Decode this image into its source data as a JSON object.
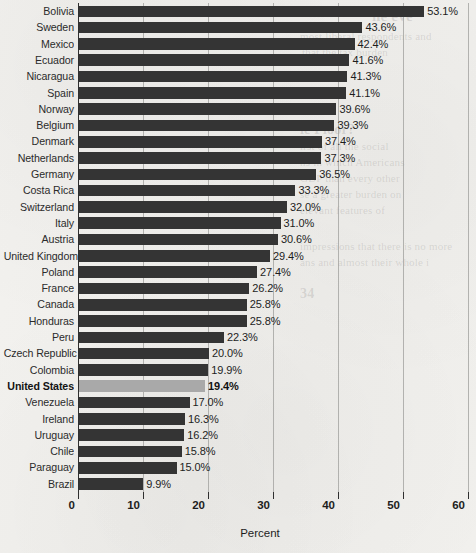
{
  "chart_data": {
    "type": "bar",
    "orientation": "horizontal",
    "title": "",
    "xlabel": "Percent",
    "ylabel": "",
    "xlim": [
      0,
      60
    ],
    "xticks": [
      0,
      10,
      20,
      30,
      40,
      50,
      60
    ],
    "grid": true,
    "legend": false,
    "value_label_suffix": "%",
    "highlight_category": "United States",
    "categories": [
      "Bolivia",
      "Sweden",
      "Mexico",
      "Ecuador",
      "Nicaragua",
      "Spain",
      "Norway",
      "Belgium",
      "Denmark",
      "Netherlands",
      "Germany",
      "Costa Rica",
      "Switzerland",
      "Italy",
      "Austria",
      "United Kingdom",
      "Poland",
      "France",
      "Canada",
      "Honduras",
      "Peru",
      "Czech Republic",
      "Colombia",
      "United States",
      "Venezuela",
      "Ireland",
      "Uruguay",
      "Chile",
      "Paraguay",
      "Brazil"
    ],
    "values": [
      53.1,
      43.6,
      42.4,
      41.6,
      41.3,
      41.1,
      39.6,
      39.3,
      37.4,
      37.3,
      36.5,
      33.3,
      32.0,
      31.0,
      30.6,
      29.4,
      27.4,
      26.2,
      25.8,
      25.8,
      22.3,
      20.0,
      19.9,
      19.4,
      17.0,
      16.3,
      16.2,
      15.8,
      15.0,
      9.9
    ],
    "value_labels": [
      "53.1%",
      "43.6%",
      "42.4%",
      "41.6%",
      "41.3%",
      "41.1%",
      "39.6%",
      "39.3%",
      "37.4%",
      "37.3%",
      "36.5%",
      "33.3%",
      "32.0%",
      "31.0%",
      "30.6%",
      "29.4%",
      "27.4%",
      "26.2%",
      "25.8%",
      "25.8%",
      "22.3%",
      "20.0%",
      "19.9%",
      "19.4%",
      "17.0%",
      "16.3%",
      "16.2%",
      "15.8%",
      "15.0%",
      "9.9%"
    ],
    "tick_labels": [
      "0",
      "10",
      "20",
      "30",
      "40",
      "50",
      "60"
    ],
    "colors": {
      "bar": "#343434",
      "bar_highlight": "#a9a9a9",
      "axis": "#2f2f2f",
      "gridline": "#9d9d9b",
      "background": "#f1f0ed",
      "text": "#1d1d1d"
    }
  },
  "page_background_text": [
    {
      "text": "he eve",
      "x": 372,
      "y": 8,
      "size": 15,
      "weight": "bold"
    },
    {
      "text": "most liberal respondents and",
      "x": 300,
      "y": 30,
      "size": 11,
      "weight": "normal"
    },
    {
      "text": "that the tax burden",
      "x": 302,
      "y": 46,
      "size": 11,
      "weight": "normal"
    },
    {
      "text": "ic Floor?",
      "x": 300,
      "y": 122,
      "size": 14,
      "weight": "bold"
    },
    {
      "text": "irst of all the social",
      "x": 300,
      "y": 140,
      "size": 11,
      "weight": "normal"
    },
    {
      "text": "ns in which Americans",
      "x": 300,
      "y": 156,
      "size": 11,
      "weight": "normal"
    },
    {
      "text": "GDP than every other",
      "x": 300,
      "y": 172,
      "size": 11,
      "weight": "normal"
    },
    {
      "text": "se a greater burden on",
      "x": 300,
      "y": 188,
      "size": 11,
      "weight": "normal"
    },
    {
      "text": "elevant features of",
      "x": 300,
      "y": 204,
      "size": 11,
      "weight": "normal"
    },
    {
      "text": "impressions that there is no more",
      "x": 300,
      "y": 240,
      "size": 11,
      "weight": "normal"
    },
    {
      "text": "ans and almost their whole i",
      "x": 300,
      "y": 256,
      "size": 11,
      "weight": "normal"
    },
    {
      "text": "34",
      "x": 300,
      "y": 286,
      "size": 14,
      "weight": "bold"
    }
  ]
}
